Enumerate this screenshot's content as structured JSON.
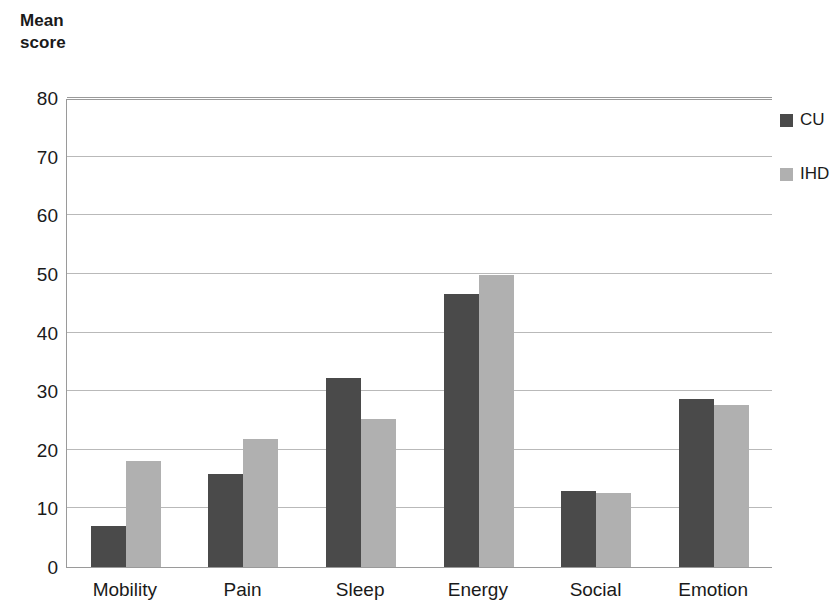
{
  "chart_data": {
    "type": "bar",
    "title": "Mean\nscore",
    "xlabel": "",
    "ylabel": "Mean score",
    "ylim": [
      0,
      80
    ],
    "yticks": [
      0,
      10,
      20,
      30,
      40,
      50,
      60,
      70,
      80
    ],
    "ytick_labels": [
      "0",
      "10",
      "20",
      "30",
      "40",
      "50",
      "60",
      "70",
      "80"
    ],
    "grid": true,
    "legend_position": "right",
    "categories": [
      "Mobility",
      "Pain",
      "Sleep",
      "Energy",
      "Social",
      "Emotion"
    ],
    "series": [
      {
        "name": "CU",
        "color": "#4a4a4a",
        "values": [
          7.0,
          15.8,
          32.2,
          46.6,
          13.0,
          28.6
        ]
      },
      {
        "name": "IHD",
        "color": "#b0b0b0",
        "values": [
          18.0,
          21.8,
          25.2,
          49.8,
          12.6,
          27.6
        ]
      }
    ]
  },
  "colors": {
    "series_cu": "#4a4a4a",
    "series_ihd": "#b0b0b0",
    "gridline": "#b9b9b9",
    "axis": "#9a9a9a",
    "text": "#1a1a1a",
    "background": "#ffffff"
  }
}
